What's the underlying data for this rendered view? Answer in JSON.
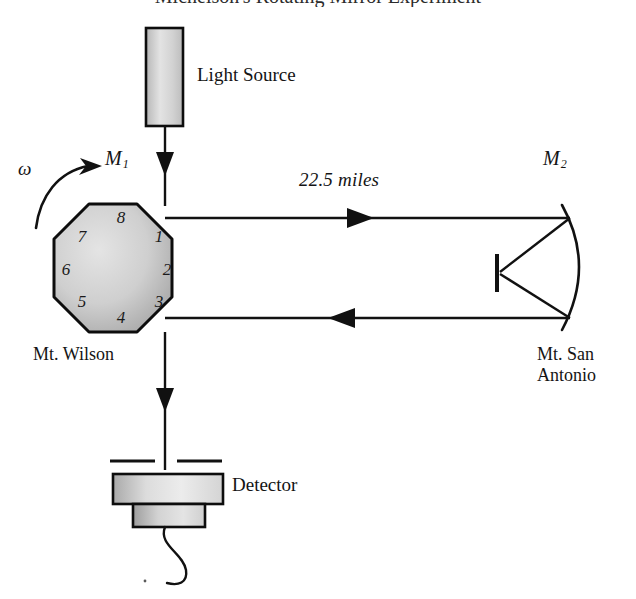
{
  "figure": {
    "title_cropped": "Michelson's Rotating Mirror Experiment",
    "width": 636,
    "height": 599,
    "background_color": "#ffffff",
    "line_color": "#111111"
  },
  "labels": {
    "light_source": "Light Source",
    "detector": "Detector",
    "distance": "22.5 miles",
    "omega": "ω",
    "mirror1": "M",
    "mirror1_sub": "1",
    "mirror2": "M",
    "mirror2_sub": "2",
    "site_left": "Mt. Wilson",
    "site_right_line1": "Mt. San",
    "site_right_line2": "Antonio"
  },
  "octagon": {
    "name": "rotating-octagonal-mirror",
    "facet_numbers": [
      "1",
      "2",
      "3",
      "4",
      "5",
      "6",
      "7",
      "8"
    ],
    "fill_light": "#e2e2e2",
    "fill_dark": "#a8a8a8",
    "stroke": "#0d0d0d"
  },
  "light_source_box": {
    "fill_light": "#e8e8e8",
    "fill_dark": "#b4b4b4",
    "stroke": "#0d0d0d"
  },
  "detector_unit": {
    "fill_light": "#e9e9e9",
    "fill_dark": "#a9a9a9",
    "stroke": "#0d0d0d"
  },
  "beams": {
    "outgoing_direction": "right",
    "returning_direction": "left",
    "source_direction": "down",
    "detector_direction": "down"
  },
  "icons": {
    "rotation_arrow": "rotation-arrow-icon",
    "arrow_down_source": "arrowhead-down-icon",
    "arrow_right_outgoing": "arrowhead-right-icon",
    "arrow_left_returning": "arrowhead-left-icon",
    "arrow_down_detector": "arrowhead-down-icon",
    "concave_mirror": "concave-mirror-icon",
    "flat_mirror": "flat-mirror-icon",
    "detector_cable": "cable-icon",
    "detector_slit": "slit-aperture-icon"
  }
}
